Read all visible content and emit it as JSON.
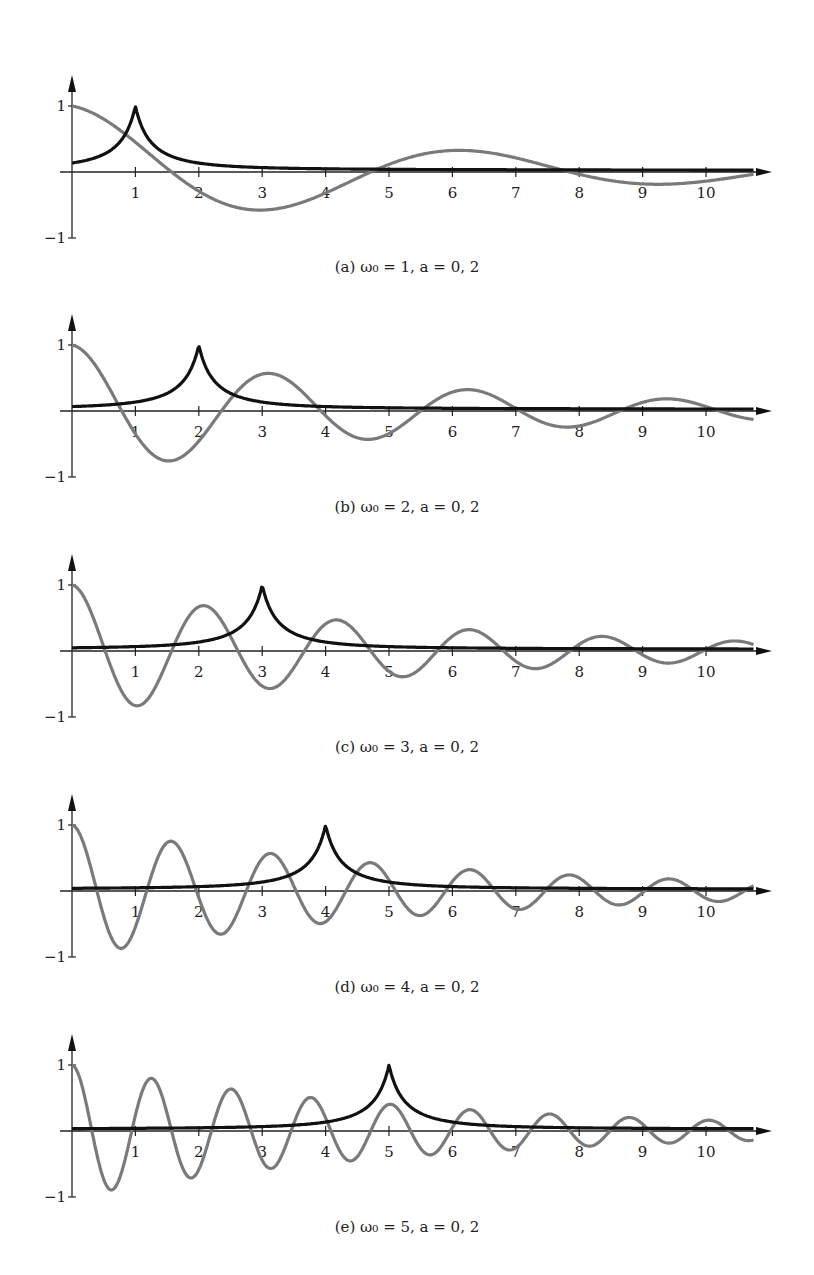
{
  "chart_data": [
    {
      "type": "line",
      "panel": "a",
      "caption": "(a) ω₀ = 1,  a = 0, 2",
      "omega0": 1,
      "a": 0.2,
      "x_ticks": [
        "1",
        "2",
        "3",
        "4",
        "5",
        "6",
        "7",
        "8",
        "9",
        "10"
      ],
      "y_ticks": [
        "1",
        "−1"
      ],
      "xlim": [
        0,
        10.8
      ],
      "ylim": [
        -1,
        1
      ],
      "series": [
        {
          "name": "spectrum (black)",
          "color": "#111111",
          "kind": "lorentzian",
          "peak_x": 1,
          "peak_y": 1
        },
        {
          "name": "damped oscillation (gray)",
          "color": "#777777",
          "kind": "damped_cos",
          "start_y": 1
        }
      ]
    },
    {
      "type": "line",
      "panel": "b",
      "caption": "(b) ω₀ = 2,  a = 0, 2",
      "omega0": 2,
      "a": 0.2,
      "x_ticks": [
        "1",
        "2",
        "3",
        "4",
        "5",
        "6",
        "7",
        "8",
        "9",
        "10"
      ],
      "y_ticks": [
        "1",
        "−1"
      ],
      "xlim": [
        0,
        10.8
      ],
      "ylim": [
        -1,
        1
      ],
      "series": [
        {
          "name": "spectrum (black)",
          "color": "#111111",
          "kind": "lorentzian",
          "peak_x": 2,
          "peak_y": 1
        },
        {
          "name": "damped oscillation (gray)",
          "color": "#777777",
          "kind": "damped_cos",
          "start_y": 1
        }
      ]
    },
    {
      "type": "line",
      "panel": "c",
      "caption": "(c) ω₀ = 3,  a = 0, 2",
      "omega0": 3,
      "a": 0.2,
      "x_ticks": [
        "1",
        "2",
        "3",
        "4",
        "5",
        "6",
        "7",
        "8",
        "9",
        "10"
      ],
      "y_ticks": [
        "1",
        "−1"
      ],
      "xlim": [
        0,
        10.8
      ],
      "ylim": [
        -1,
        1
      ],
      "series": [
        {
          "name": "spectrum (black)",
          "color": "#111111",
          "kind": "lorentzian",
          "peak_x": 3,
          "peak_y": 1
        },
        {
          "name": "damped oscillation (gray)",
          "color": "#777777",
          "kind": "damped_cos",
          "start_y": 1
        }
      ]
    },
    {
      "type": "line",
      "panel": "d",
      "caption": "(d) ω₀ = 4,  a = 0, 2",
      "omega0": 4,
      "a": 0.2,
      "x_ticks": [
        "1",
        "2",
        "3",
        "4",
        "5",
        "6",
        "7",
        "8",
        "9",
        "10"
      ],
      "y_ticks": [
        "1",
        "−1"
      ],
      "xlim": [
        0,
        10.8
      ],
      "ylim": [
        -1,
        1
      ],
      "series": [
        {
          "name": "spectrum (black)",
          "color": "#111111",
          "kind": "lorentzian",
          "peak_x": 4,
          "peak_y": 1
        },
        {
          "name": "damped oscillation (gray)",
          "color": "#777777",
          "kind": "damped_cos",
          "start_y": 1
        }
      ]
    },
    {
      "type": "line",
      "panel": "e",
      "caption": "(e) ω₀ = 5,  a = 0, 2",
      "omega0": 5,
      "a": 0.2,
      "x_ticks": [
        "1",
        "2",
        "3",
        "4",
        "5",
        "6",
        "7",
        "8",
        "9",
        "10"
      ],
      "y_ticks": [
        "1",
        "−1"
      ],
      "xlim": [
        0,
        10.8
      ],
      "ylim": [
        -1,
        1
      ],
      "series": [
        {
          "name": "spectrum (black)",
          "color": "#111111",
          "kind": "lorentzian",
          "peak_x": 5,
          "peak_y": 1
        },
        {
          "name": "damped oscillation (gray)",
          "color": "#777777",
          "kind": "damped_cos",
          "start_y": 1
        }
      ]
    }
  ],
  "captions": {
    "a": "(a) ω₀ = 1,  a = 0, 2",
    "b": "(b) ω₀ = 2,  a = 0, 2",
    "c": "(c) ω₀ = 3,  a = 0, 2",
    "d": "(d) ω₀ = 4,  a = 0, 2",
    "e": "(e) ω₀ = 5,  a = 0, 2"
  },
  "style": {
    "axis_color": "#222222",
    "black_curve": "#111111",
    "gray_curve": "#7a7a7a"
  }
}
